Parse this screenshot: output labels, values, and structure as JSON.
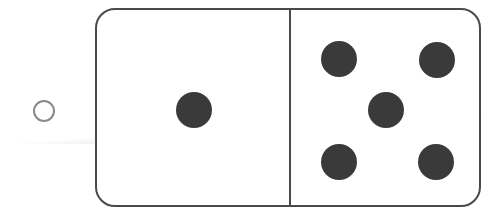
{
  "page": {
    "background_color": "#ffffff",
    "width": 502,
    "height": 214
  },
  "ghost": {
    "line1": "insert sheet",
    "line2": "a worksheet"
  },
  "answer_bubble": {
    "label": "",
    "state": "unselected",
    "shape": "circle-outline",
    "stroke_color": "#8a8a8a",
    "fill_color": "#ffffff",
    "cx": 44,
    "cy": 111,
    "r": 11
  },
  "domino": {
    "border_color": "#4a4a4a",
    "fill_color": "#ffffff",
    "pip_color": "#3a3a3a",
    "corner_radius": 20,
    "total_pips": 6,
    "halves": [
      {
        "name": "left-half",
        "pip_count": 1,
        "pips": [
          {
            "cx": 97,
            "cy": 100
          }
        ]
      },
      {
        "name": "right-half",
        "pip_count": 5,
        "pips": [
          {
            "cx": 48,
            "cy": 49
          },
          {
            "cx": 146,
            "cy": 50
          },
          {
            "cx": 95,
            "cy": 100
          },
          {
            "cx": 48,
            "cy": 152
          },
          {
            "cx": 145,
            "cy": 152
          }
        ]
      }
    ]
  }
}
